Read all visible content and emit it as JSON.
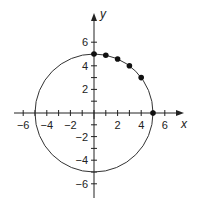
{
  "chart_data": {
    "type": "scatter",
    "title": "",
    "xlabel": "x",
    "ylabel": "y",
    "xlim": [
      -7,
      7
    ],
    "ylim": [
      -7,
      7
    ],
    "grid": false,
    "x_tick_labels": [
      "-6",
      "-4",
      "-2",
      "2",
      "4",
      "6"
    ],
    "x_tick_values": [
      -6,
      -4,
      -2,
      2,
      4,
      6
    ],
    "y_tick_labels": [
      "6",
      "4",
      "2",
      "-2",
      "-4",
      "-6"
    ],
    "y_tick_values": [
      6,
      4,
      2,
      -2,
      -4,
      -6
    ],
    "circle": {
      "center": [
        0,
        0
      ],
      "radius": 5
    },
    "series": [
      {
        "name": "points on circle",
        "x": [
          0,
          1,
          2,
          3,
          4,
          5
        ],
        "y": [
          5,
          4.9,
          4.58,
          4,
          3,
          0
        ]
      }
    ]
  }
}
